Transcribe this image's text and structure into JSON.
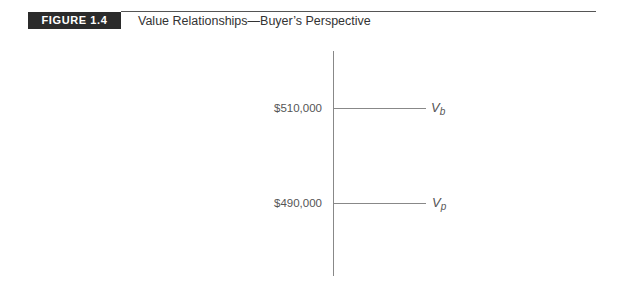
{
  "header": {
    "badge": "FIGURE 1.4",
    "title": "Value Relationships—Buyer’s Perspective"
  },
  "diagram": {
    "levels": [
      {
        "value_label": "$510,000",
        "variable": "V",
        "subscript": "b"
      },
      {
        "value_label": "$490,000",
        "variable": "V",
        "subscript": "p"
      }
    ]
  },
  "colors": {
    "badge_bg": "#2b2b2b",
    "badge_text": "#ffffff",
    "line": "#888888",
    "text": "#333333"
  }
}
